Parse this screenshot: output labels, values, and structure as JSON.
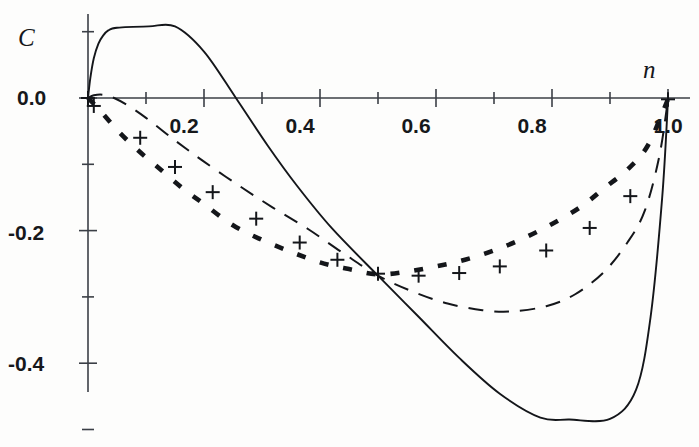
{
  "chart_data": {
    "type": "line",
    "title": "",
    "xlabel": "n",
    "ylabel": "C",
    "xlim": [
      0.0,
      1.0
    ],
    "ylim": [
      -0.5,
      0.13
    ],
    "grid": false,
    "legend": "none",
    "x_ticks_major": [
      "0.2",
      "0.4",
      "0.6",
      "0.8",
      "1.0"
    ],
    "x_tick_values_major": [
      0.2,
      0.4,
      0.6,
      0.8,
      1.0
    ],
    "x_tick_values_minor": [
      0.1,
      0.3,
      0.5,
      0.7,
      0.9
    ],
    "y_ticks_major": [
      "0.0",
      "-0.2",
      "-0.4"
    ],
    "y_tick_values_major": [
      0.0,
      -0.2,
      -0.4
    ],
    "y_tick_values_minor": [
      0.1,
      -0.1,
      -0.3,
      -0.5
    ],
    "series": [
      {
        "name": "solid-curve",
        "style": "solid",
        "x": [
          0.0,
          0.004,
          0.01,
          0.018,
          0.026,
          0.035,
          0.05,
          0.105,
          0.15,
          0.2,
          0.255,
          0.31,
          0.36,
          0.42,
          0.5,
          0.57,
          0.64,
          0.71,
          0.78,
          0.83,
          0.9,
          0.945,
          0.97,
          0.99,
          1.0
        ],
        "y": [
          0.0,
          0.03,
          0.06,
          0.082,
          0.094,
          0.102,
          0.106,
          0.108,
          0.108,
          0.07,
          0.0,
          -0.072,
          -0.132,
          -0.196,
          -0.268,
          -0.33,
          -0.392,
          -0.446,
          -0.482,
          -0.485,
          -0.484,
          -0.44,
          -0.33,
          -0.15,
          -0.003
        ]
      },
      {
        "name": "dashed-curve",
        "style": "dashed",
        "x": [
          0.0,
          0.01,
          0.025,
          0.045,
          0.07,
          0.1,
          0.15,
          0.2,
          0.26,
          0.32,
          0.38,
          0.44,
          0.5,
          0.56,
          0.62,
          0.68,
          0.73,
          0.79,
          0.84,
          0.89,
          0.93,
          0.96,
          0.985,
          1.0
        ],
        "y": [
          0.0,
          0.004,
          0.005,
          0.0,
          -0.012,
          -0.03,
          -0.064,
          -0.096,
          -0.132,
          -0.166,
          -0.198,
          -0.234,
          -0.268,
          -0.292,
          -0.31,
          -0.32,
          -0.322,
          -0.314,
          -0.296,
          -0.262,
          -0.218,
          -0.17,
          -0.088,
          -0.002
        ]
      },
      {
        "name": "dotted-curve",
        "style": "dotted",
        "x": [
          0.0,
          0.02,
          0.05,
          0.085,
          0.12,
          0.16,
          0.2,
          0.25,
          0.3,
          0.35,
          0.4,
          0.45,
          0.5,
          0.55,
          0.6,
          0.65,
          0.7,
          0.75,
          0.8,
          0.85,
          0.89,
          0.93,
          0.965,
          1.0
        ],
        "y": [
          0.0,
          -0.018,
          -0.048,
          -0.078,
          -0.104,
          -0.134,
          -0.16,
          -0.192,
          -0.214,
          -0.232,
          -0.248,
          -0.258,
          -0.266,
          -0.262,
          -0.254,
          -0.244,
          -0.23,
          -0.212,
          -0.19,
          -0.164,
          -0.136,
          -0.108,
          -0.072,
          -0.002
        ]
      }
    ],
    "markers": {
      "name": "plus-markers",
      "symbol": "+",
      "x": [
        0.0,
        0.01,
        0.09,
        0.15,
        0.215,
        0.29,
        0.365,
        0.43,
        0.5,
        0.57,
        0.64,
        0.71,
        0.79,
        0.865,
        0.935,
        1.0
      ],
      "y": [
        0.0,
        -0.012,
        -0.06,
        -0.104,
        -0.142,
        -0.182,
        -0.218,
        -0.244,
        -0.265,
        -0.268,
        -0.264,
        -0.254,
        -0.23,
        -0.196,
        -0.148,
        -0.002
      ]
    }
  },
  "labels": {
    "y_axis": "C",
    "x_axis": "n",
    "y_0": "0.0",
    "y_m02": "-0.2",
    "y_m04": "-0.4",
    "x_02": "0.2",
    "x_04": "0.4",
    "x_06": "0.6",
    "x_08": "0.8",
    "x_10": "1.0"
  },
  "colors": {
    "ink": "#14161a",
    "axis": "#3b3f46",
    "paper": "#fdfdfc"
  }
}
